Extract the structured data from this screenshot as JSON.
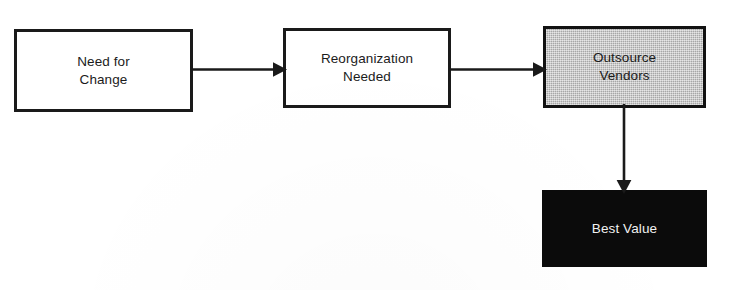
{
  "diagram": {
    "type": "flowchart",
    "orientation": "left-to-right with downward branch",
    "background_color": "#ffffff",
    "nodes": [
      {
        "id": "need-for-change",
        "label": "Need for\nChange",
        "shape": "rectangle",
        "fill": "#ffffff",
        "border_color": "#1a1a1a",
        "text_color": "#1b1b1b"
      },
      {
        "id": "reorganization-needed",
        "label": "Reorganization\nNeeded",
        "shape": "rectangle",
        "fill": "#ffffff",
        "border_color": "#1a1a1a",
        "text_color": "#1b1b1b"
      },
      {
        "id": "outsource-vendors",
        "label": "Outsource\nVendors",
        "shape": "rectangle",
        "fill": "#bbbbbb",
        "border_color": "#121212",
        "text_color": "#1b1b1b"
      },
      {
        "id": "best-value",
        "label": "Best Value",
        "shape": "rectangle",
        "fill": "#0b0b0b",
        "border_color": "#0b0b0b",
        "text_color": "#f2f2f2"
      }
    ],
    "edges": [
      {
        "id": "change-to-reorg",
        "from": "need-for-change",
        "to": "reorganization-needed",
        "direction": "right",
        "label": "",
        "color": "#1a1a1a"
      },
      {
        "id": "reorg-to-vendor",
        "from": "reorganization-needed",
        "to": "outsource-vendors",
        "direction": "right",
        "label": "",
        "color": "#1a1a1a"
      },
      {
        "id": "vendor-to-value",
        "from": "outsource-vendors",
        "to": "best-value",
        "direction": "down",
        "label": "",
        "color": "#1a1a1a"
      }
    ]
  }
}
